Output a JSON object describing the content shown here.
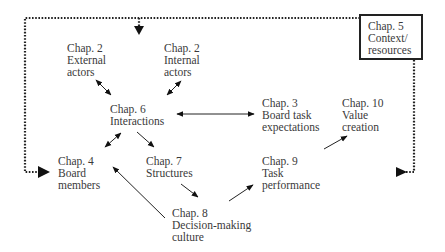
{
  "diagram": {
    "nodes": [
      {
        "id": "ch2-external",
        "lines": [
          "Chap. 2",
          "External",
          "actors"
        ]
      },
      {
        "id": "ch2-internal",
        "lines": [
          "Chap. 2",
          "Internal",
          "actors"
        ]
      },
      {
        "id": "ch5-context",
        "lines": [
          "Chap. 5",
          "Context/",
          "resources"
        ],
        "boxed": true
      },
      {
        "id": "ch6-interactions",
        "lines": [
          "Chap. 6",
          "Interactions"
        ]
      },
      {
        "id": "ch3-board-task",
        "lines": [
          "Chap. 3",
          "Board task",
          "expectations"
        ]
      },
      {
        "id": "ch10-value",
        "lines": [
          "Chap. 10",
          "Value",
          "creation"
        ]
      },
      {
        "id": "ch4-board-members",
        "lines": [
          "Chap. 4",
          "Board",
          "members"
        ]
      },
      {
        "id": "ch7-structures",
        "lines": [
          "Chap. 7",
          "Structures"
        ]
      },
      {
        "id": "ch9-task-performance",
        "lines": [
          "Chap. 9",
          "Task",
          "performance"
        ]
      },
      {
        "id": "ch8-decision-making",
        "lines": [
          "Chap. 8",
          "Decision-making",
          "culture"
        ]
      }
    ],
    "edges": [
      {
        "from": "ch2-external",
        "to": "ch6-interactions",
        "style": "solid",
        "bidirectional": true
      },
      {
        "from": "ch2-internal",
        "to": "ch6-interactions",
        "style": "solid",
        "bidirectional": true
      },
      {
        "from": "ch6-interactions",
        "to": "ch3-board-task",
        "style": "solid",
        "bidirectional": true
      },
      {
        "from": "ch6-interactions",
        "to": "ch4-board-members",
        "style": "solid",
        "bidirectional": true
      },
      {
        "from": "ch6-interactions",
        "to": "ch7-structures",
        "style": "solid",
        "bidirectional": false
      },
      {
        "from": "ch7-structures",
        "to": "ch8-decision-making",
        "style": "solid",
        "bidirectional": false
      },
      {
        "from": "ch8-decision-making",
        "to": "ch4-board-members",
        "style": "solid",
        "bidirectional": false
      },
      {
        "from": "ch8-decision-making",
        "to": "ch9-task-performance",
        "style": "solid",
        "bidirectional": false
      },
      {
        "from": "ch9-task-performance",
        "to": "ch10-value",
        "style": "solid",
        "bidirectional": false
      },
      {
        "from": "ch5-context",
        "to": "ch6-interactions",
        "style": "dotted",
        "bidirectional": false
      },
      {
        "from": "ch5-context",
        "to": "ch4-board-members",
        "style": "dotted",
        "bidirectional": false
      },
      {
        "from": "ch5-context",
        "to": "ch10-value",
        "style": "dotted",
        "bidirectional": false
      }
    ]
  }
}
